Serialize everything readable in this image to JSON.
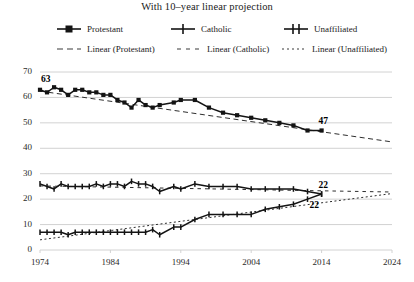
{
  "chart_data": {
    "type": "line",
    "title": "With 10–year linear projection",
    "xlabel": "",
    "ylabel": "",
    "xlim": [
      1974,
      2024
    ],
    "ylim": [
      0,
      70
    ],
    "grid": true,
    "legend_position": "top",
    "xticks": [
      "1974",
      "1984",
      "1994",
      "2004",
      "2014",
      "2024"
    ],
    "yticks": [
      "0",
      "10",
      "20",
      "30",
      "40",
      "50",
      "60",
      "70"
    ],
    "x": [
      1974,
      1975,
      1976,
      1977,
      1978,
      1979,
      1980,
      1981,
      1982,
      1983,
      1984,
      1985,
      1986,
      1987,
      1988,
      1989,
      1990,
      1991,
      1993,
      1994,
      1996,
      1998,
      2000,
      2002,
      2004,
      2006,
      2008,
      2010,
      2012,
      2014
    ],
    "series": [
      {
        "name": "Protestant",
        "marker": "square",
        "values": [
          63,
          62,
          64,
          63,
          61,
          63,
          63,
          62,
          62,
          61,
          61,
          59,
          58,
          56,
          59,
          57,
          56,
          57,
          58,
          59,
          59,
          56,
          54,
          53,
          52,
          51,
          50,
          49,
          47,
          47
        ]
      },
      {
        "name": "Catholic",
        "marker": "cross",
        "values": [
          26,
          25,
          24,
          26,
          25,
          25,
          25,
          25,
          26,
          25,
          26,
          26,
          25,
          27,
          26,
          26,
          25,
          23,
          25,
          24,
          26,
          25,
          25,
          25,
          24,
          24,
          24,
          24,
          23,
          22
        ]
      },
      {
        "name": "Unaffiliated",
        "marker": "cross",
        "values": [
          7,
          7,
          7,
          7,
          6,
          7,
          7,
          7,
          7,
          7,
          7,
          7,
          7,
          7,
          7,
          7,
          8,
          6,
          9,
          9,
          12,
          14,
          14,
          14,
          14,
          16,
          17,
          18,
          20,
          22
        ]
      }
    ],
    "trendlines": [
      {
        "name": "Linear (Protestant)",
        "x_start": 1974,
        "x_end": 2024,
        "y_start": 62.5,
        "y_end": 42.5,
        "dash": "long"
      },
      {
        "name": "Linear (Catholic)",
        "x_start": 1974,
        "x_end": 2024,
        "y_start": 25.2,
        "y_end": 22.8,
        "dash": "medium"
      },
      {
        "name": "Linear (Unaffiliated)",
        "x_start": 1974,
        "x_end": 2024,
        "y_start": 4.0,
        "y_end": 22.2,
        "dash": "short"
      }
    ],
    "annotations": [
      {
        "text": "63",
        "x": 1974,
        "y": 63,
        "position": "above-right"
      },
      {
        "text": "47",
        "x": 2014,
        "y": 47,
        "position": "above-left"
      },
      {
        "text": "22",
        "x": 2014,
        "y": 22,
        "position": "above-left"
      },
      {
        "text": "22",
        "x": 2014,
        "y": 22,
        "position": "below-left"
      }
    ]
  },
  "legend": {
    "entries": [
      {
        "label": "Protestant",
        "symbol": "line-square-marker"
      },
      {
        "label": "Catholic",
        "symbol": "line-cross-marker"
      },
      {
        "label": "Unaffiliated",
        "symbol": "line-cross-marker"
      },
      {
        "label": "Linear (Protestant)",
        "symbol": "dashed-long"
      },
      {
        "label": "Linear (Catholic)",
        "symbol": "dashed-medium"
      },
      {
        "label": "Linear (Unaffiliated)",
        "symbol": "dashed-short"
      }
    ]
  },
  "colors": {
    "series": "#141414",
    "grid": "#d2d2d2",
    "text": "#1a1a1a"
  }
}
